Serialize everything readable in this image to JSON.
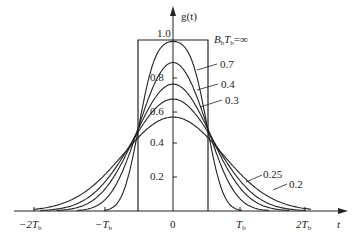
{
  "chart_data": {
    "type": "line",
    "title": "",
    "xlabel": "t",
    "ylabel": "g(t)",
    "x_ticks": [
      "-2T_b",
      "-T_b",
      "0",
      "T_b",
      "2T_b"
    ],
    "x_tick_values": [
      -2,
      -1,
      0,
      1,
      2
    ],
    "y_ticks": [
      "0.2",
      "0.4",
      "0.6",
      "0.8",
      "1.0"
    ],
    "y_tick_values": [
      0.2,
      0.4,
      0.6,
      0.8,
      1.0
    ],
    "xlim": [
      -2.0,
      2.0
    ],
    "ylim": [
      0,
      1.0
    ],
    "grid": false,
    "series": [
      {
        "name": "B_bT_b = ∞",
        "label": "BbTb=∞",
        "bt": "inf",
        "peak": 1.0
      },
      {
        "name": "0.7",
        "label": "0.7",
        "bt": 0.7,
        "peak": 0.88
      },
      {
        "name": "0.4",
        "label": "0.4",
        "bt": 0.4,
        "peak": 0.75
      },
      {
        "name": "0.3",
        "label": "0.3",
        "bt": 0.3,
        "peak": 0.66
      },
      {
        "name": "0.25",
        "label": "0.25",
        "bt": 0.25,
        "peak": 0.6
      },
      {
        "name": "0.2",
        "label": "0.2",
        "bt": 0.2,
        "peak": 0.55
      }
    ],
    "annotations": [
      "B_bT_b = ∞",
      "0.7",
      "0.4",
      "0.3",
      "0.25",
      "0.2"
    ]
  },
  "labels": {
    "y_axis": "g(t)",
    "x_axis": "t",
    "bt_inf": "BbTb=∞",
    "bt_inf_B": "B",
    "bt_inf_b1": "b",
    "bt_inf_T": "T",
    "bt_inf_b2": "b",
    "bt_inf_eq": "=∞",
    "bt_07": "0.7",
    "bt_04": "0.4",
    "bt_03": "0.3",
    "bt_025": "0.25",
    "bt_02": "0.2",
    "y_10": "1.0",
    "y_08": "0.8",
    "y_06": "0.6",
    "y_04": "0.4",
    "y_02": "0.2",
    "x_m2": "−2T",
    "x_m1": "−T",
    "x_0": "0",
    "x_p1": "T",
    "x_p2": "2T",
    "sub_b": "b"
  }
}
